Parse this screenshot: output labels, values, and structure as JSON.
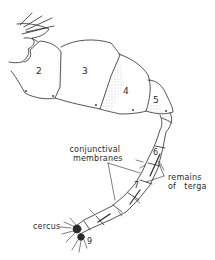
{
  "figure": {
    "segment_labels": [
      "2",
      "3",
      "4",
      "5",
      "6",
      "7",
      "9"
    ],
    "annotations": {
      "conjunctival_membranes": [
        "conjunctival",
        "membranes"
      ],
      "remains_of_terga": [
        "remains",
        "of   terga"
      ],
      "cercus": "cercus"
    },
    "colors": {
      "ink": "#2a2a2a",
      "stipple": "#9a9a9a",
      "background": "#ffffff"
    }
  }
}
